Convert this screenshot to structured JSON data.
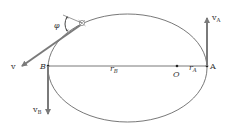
{
  "diagram": {
    "title": "",
    "type": "elliptical-orbit",
    "colors": {
      "background": "#ffffff",
      "orbit": "#555555",
      "vector": "#7a7a7a",
      "text": "#333333"
    },
    "points": {
      "A": {
        "label": "A"
      },
      "B": {
        "label": "B"
      },
      "O": {
        "label": "O"
      }
    },
    "distances": {
      "rA": {
        "main": "r",
        "sub": "A"
      },
      "rB": {
        "main": "r",
        "sub": "B"
      }
    },
    "vectors": {
      "vA": {
        "main": "v",
        "sub": "A"
      },
      "vB": {
        "main": "v",
        "sub": "B"
      },
      "v": {
        "main": "v"
      }
    },
    "angle": {
      "symbol": "φ"
    }
  }
}
